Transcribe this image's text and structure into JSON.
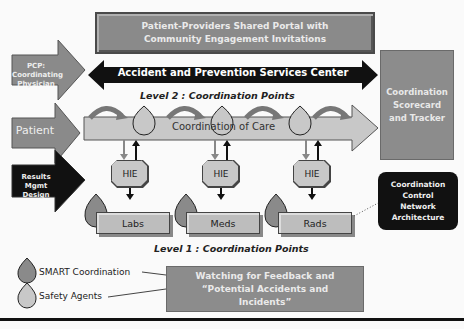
{
  "portal": {
    "label": "Patient-Providers Shared Portal with Community Engagement Invitations"
  },
  "center_arrow": {
    "label": "Accident and Prevention Services Center"
  },
  "level2": {
    "label": "Level 2 : Coordination Points"
  },
  "level1": {
    "label": "Level 1 : Coordination Points"
  },
  "care_arrow": {
    "label": "Coordination of Care"
  },
  "inputs": [
    {
      "label": "PCP: Coordinating Physician",
      "color": "#8a8a8a"
    },
    {
      "label": "Patient",
      "color": "#8a8a8a"
    },
    {
      "label": "Results Mgmt Design",
      "color": "#111111"
    }
  ],
  "scorecard": {
    "label": "Coordination Scorecard and Tracker"
  },
  "control_network": {
    "label": "Coordination Control Network Architecture"
  },
  "hie_nodes": [
    {
      "label": "HIE"
    },
    {
      "label": "HIE"
    },
    {
      "label": "HIE"
    }
  ],
  "departments": [
    {
      "label": "Labs"
    },
    {
      "label": "Meds"
    },
    {
      "label": "Rads"
    }
  ],
  "legend": {
    "smart": {
      "label": "SMART Coordination",
      "color": "#8a8a8a"
    },
    "safety": {
      "label": "Safety Agents",
      "color": "#c8c8c8"
    }
  },
  "watch_box": {
    "label": "Watching for Feedback and “Potential Accidents and Incidents”"
  }
}
